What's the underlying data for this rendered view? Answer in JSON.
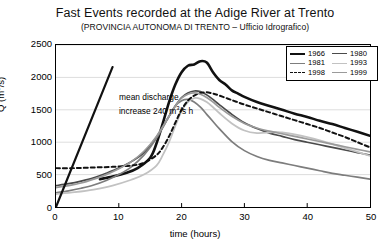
{
  "chart_data": {
    "type": "line",
    "title": "Fast Events recorded at the Adige River at Trento",
    "subtitle": "(PROVINCIA AUTONOMA DI TRENTO – Ufficio Idrografico)",
    "xlabel": "time (hours)",
    "ylabel": "Q (m3/s)",
    "ylabel_display": "Q (m³/s)",
    "xlim": [
      0,
      50
    ],
    "ylim": [
      0,
      2500
    ],
    "xticks": [
      0,
      10,
      20,
      30,
      40,
      50
    ],
    "yticks": [
      0,
      500,
      1000,
      1500,
      2000,
      2500
    ],
    "grid": "horizontal",
    "legend_position": "top-right",
    "annotation": {
      "line1": "mean discharge",
      "line2_pre": "increase 240 m",
      "line2_sup": "3",
      "line2_post": "/s h"
    },
    "series": [
      {
        "name": "1966",
        "color": "#111111",
        "width": 2.6,
        "dash": "none",
        "x": [
          7,
          9,
          11,
          13,
          15,
          16,
          17,
          18,
          19,
          20,
          21,
          22,
          23,
          24,
          25,
          26,
          27,
          28,
          29,
          30,
          32,
          34,
          36,
          38,
          40,
          42,
          44,
          46,
          48,
          50
        ],
        "y": [
          430,
          470,
          520,
          600,
          760,
          980,
          1290,
          1620,
          1890,
          2080,
          2180,
          2200,
          2250,
          2230,
          2080,
          1960,
          1890,
          1800,
          1750,
          1700,
          1620,
          1560,
          1500,
          1440,
          1390,
          1330,
          1280,
          1220,
          1160,
          1100
        ]
      },
      {
        "name": "1980",
        "color": "#4a4a4a",
        "width": 1.7,
        "dash": "none",
        "x": [
          0,
          2,
          4,
          6,
          8,
          10,
          12,
          14,
          16,
          18,
          19,
          20,
          21,
          22,
          23,
          24,
          25,
          26,
          28,
          30,
          32,
          34,
          36,
          38,
          40,
          42,
          44,
          46,
          48,
          50
        ],
        "y": [
          330,
          360,
          400,
          450,
          520,
          600,
          700,
          840,
          1080,
          1400,
          1560,
          1690,
          1760,
          1790,
          1780,
          1730,
          1660,
          1580,
          1430,
          1300,
          1210,
          1140,
          1090,
          1040,
          1000,
          960,
          920,
          880,
          840,
          800
        ]
      },
      {
        "name": "1981",
        "color": "#7d7d7d",
        "width": 1.7,
        "dash": "none",
        "x": [
          0,
          2,
          4,
          6,
          8,
          10,
          12,
          14,
          16,
          18,
          19,
          20,
          21,
          22,
          23,
          24,
          25,
          26,
          28,
          30,
          32,
          34,
          36,
          38,
          40,
          42,
          44,
          46,
          48,
          50
        ],
        "y": [
          220,
          250,
          290,
          340,
          410,
          500,
          620,
          800,
          1060,
          1400,
          1560,
          1640,
          1660,
          1620,
          1540,
          1430,
          1320,
          1210,
          1010,
          870,
          780,
          720,
          680,
          640,
          600,
          560,
          520,
          490,
          460,
          430
        ]
      },
      {
        "name": "1993",
        "color": "#c2c2c2",
        "width": 1.8,
        "dash": "none",
        "x": [
          0,
          3,
          6,
          9,
          12,
          14,
          16,
          17,
          18,
          19,
          20,
          21,
          22,
          23,
          24,
          25,
          26,
          28,
          30,
          32,
          34,
          35,
          36,
          38,
          40,
          42,
          44,
          46,
          48,
          50
        ],
        "y": [
          200,
          230,
          270,
          330,
          420,
          500,
          640,
          800,
          1000,
          1250,
          1480,
          1620,
          1680,
          1670,
          1620,
          1540,
          1450,
          1290,
          1180,
          1140,
          1150,
          1160,
          1150,
          1120,
          1080,
          1030,
          970,
          910,
          850,
          790
        ]
      },
      {
        "name": "1998",
        "color": "#111111",
        "width": 2.0,
        "dash": "4,3",
        "x": [
          0,
          3,
          6,
          9,
          12,
          14,
          16,
          17,
          18,
          19,
          20,
          21,
          22,
          23,
          24,
          25,
          26,
          28,
          30,
          32,
          34,
          36,
          38,
          40,
          42,
          44,
          46,
          48,
          50
        ],
        "y": [
          600,
          600,
          610,
          620,
          640,
          680,
          800,
          920,
          1090,
          1300,
          1500,
          1640,
          1720,
          1760,
          1770,
          1750,
          1720,
          1650,
          1580,
          1520,
          1460,
          1400,
          1340,
          1280,
          1220,
          1150,
          1080,
          1000,
          920
        ]
      },
      {
        "name": "1999",
        "color": "#9a9a9a",
        "width": 1.7,
        "dash": "none",
        "x": [
          0,
          2,
          4,
          6,
          8,
          10,
          12,
          14,
          16,
          18,
          19,
          20,
          21,
          22,
          23,
          24,
          25,
          26,
          28,
          30,
          32,
          34,
          36,
          38,
          40,
          42,
          44,
          46,
          48,
          50
        ],
        "y": [
          300,
          330,
          370,
          430,
          500,
          590,
          700,
          860,
          1090,
          1400,
          1560,
          1680,
          1740,
          1760,
          1740,
          1690,
          1620,
          1540,
          1400,
          1290,
          1220,
          1170,
          1130,
          1090,
          1050,
          1010,
          970,
          930,
          890,
          850
        ]
      },
      {
        "name": "mean discharge increase reference",
        "color": "#111111",
        "width": 2.2,
        "dash": "none",
        "x": [
          0,
          9
        ],
        "y": [
          0,
          2160
        ]
      }
    ]
  },
  "legend": {
    "rows": [
      [
        {
          "label": "1966",
          "color": "#111111",
          "width": 2.6,
          "dash": "none"
        },
        {
          "label": "1980",
          "color": "#4a4a4a",
          "width": 1.8,
          "dash": "none"
        }
      ],
      [
        {
          "label": "1981",
          "color": "#7d7d7d",
          "width": 1.6,
          "dash": "none"
        },
        {
          "label": "1993",
          "color": "#c2c2c2",
          "width": 1.8,
          "dash": "none"
        }
      ],
      [
        {
          "label": "1998",
          "color": "#111111",
          "width": 1.8,
          "dash": "dashed"
        },
        {
          "label": "1999",
          "color": "#9a9a9a",
          "width": 1.6,
          "dash": "none"
        }
      ]
    ]
  }
}
